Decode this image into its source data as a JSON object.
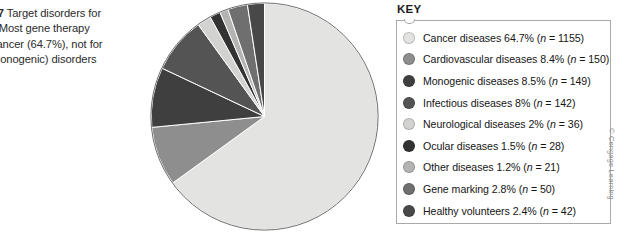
{
  "caption": {
    "label": "E 16.17",
    "text": " Target disorders for\nerapy. Most gene therapy\ne for cancer (64.7%), not for\nene (monogenic) disorders"
  },
  "key": {
    "title": "KEY"
  },
  "credit": {
    "text": "© Cengage Learning"
  },
  "chart_data": {
    "type": "pie",
    "unit": "percent",
    "total_n": 1773,
    "start_angle_deg": 0,
    "direction": "counterclockwise",
    "legend_position": "right",
    "grid": false,
    "categories": [
      "Cancer diseases",
      "Cardiovascular diseases",
      "Monogenic diseases",
      "Infectious diseases",
      "Neurological diseases",
      "Ocular diseases",
      "Other diseases",
      "Gene marking",
      "Healthy volunteers"
    ],
    "values": [
      64.7,
      8.4,
      8.5,
      8,
      2,
      1.5,
      1.2,
      2.8,
      2.4
    ],
    "counts": [
      1155,
      150,
      149,
      142,
      36,
      28,
      21,
      50,
      42
    ],
    "colors": [
      "#e3e3e1",
      "#8e8e8e",
      "#3f3f3f",
      "#545454",
      "#d2d2d0",
      "#333333",
      "#b4b4b2",
      "#6f6f6f",
      "#484848"
    ],
    "slices": [
      {
        "label": "Cancer diseases",
        "percent": "64.7%",
        "n_label": "(n = 1155)",
        "value": 64.7,
        "count": 1155,
        "color": "#e3e3e1"
      },
      {
        "label": "Cardiovascular diseases",
        "percent": "8.4%",
        "n_label": "(n = 150)",
        "value": 8.4,
        "count": 150,
        "color": "#8e8e8e"
      },
      {
        "label": "Monogenic diseases",
        "percent": "8.5%",
        "n_label": "(n = 149)",
        "value": 8.5,
        "count": 149,
        "color": "#3f3f3f"
      },
      {
        "label": "Infectious diseases",
        "percent": "8%",
        "n_label": "(n = 142)",
        "value": 8,
        "count": 142,
        "color": "#545454"
      },
      {
        "label": "Neurological diseases",
        "percent": "2%",
        "n_label": "(n = 36)",
        "value": 2,
        "count": 36,
        "color": "#d2d2d0"
      },
      {
        "label": "Ocular diseases",
        "percent": "1.5%",
        "n_label": "(n = 28)",
        "value": 1.5,
        "count": 28,
        "color": "#333333"
      },
      {
        "label": "Other diseases",
        "percent": "1.2%",
        "n_label": "(n = 21)",
        "value": 1.2,
        "count": 21,
        "color": "#b4b4b2"
      },
      {
        "label": "Gene marking",
        "percent": "2.8%",
        "n_label": "(n = 50)",
        "value": 2.8,
        "count": 50,
        "color": "#6f6f6f"
      },
      {
        "label": "Healthy volunteers",
        "percent": "2.4%",
        "n_label": "(n = 42)",
        "value": 2.4,
        "count": 42,
        "color": "#484848"
      }
    ]
  }
}
